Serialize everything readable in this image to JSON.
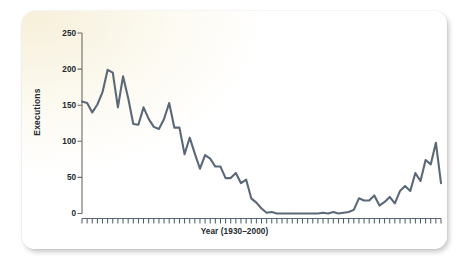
{
  "chart_data": {
    "type": "line",
    "title": "",
    "xlabel": "Year (1930–2000)",
    "ylabel": "Executions",
    "xlim": [
      1930,
      2000
    ],
    "ylim": [
      0,
      250
    ],
    "yticks": [
      0,
      50,
      100,
      150,
      200,
      250
    ],
    "grid": false,
    "legend": null,
    "line_color": "#5b6878",
    "x": [
      1930,
      1931,
      1932,
      1933,
      1934,
      1935,
      1936,
      1937,
      1938,
      1939,
      1940,
      1941,
      1942,
      1943,
      1944,
      1945,
      1946,
      1947,
      1948,
      1949,
      1950,
      1951,
      1952,
      1953,
      1954,
      1955,
      1956,
      1957,
      1958,
      1959,
      1960,
      1961,
      1962,
      1963,
      1964,
      1965,
      1966,
      1967,
      1968,
      1969,
      1970,
      1971,
      1972,
      1973,
      1974,
      1975,
      1976,
      1977,
      1978,
      1979,
      1980,
      1981,
      1982,
      1983,
      1984,
      1985,
      1986,
      1987,
      1988,
      1989,
      1990,
      1991,
      1992,
      1993,
      1994,
      1995,
      1996,
      1997,
      1998,
      1999,
      2000
    ],
    "values": [
      155,
      153,
      140,
      151,
      168,
      199,
      195,
      147,
      190,
      160,
      124,
      123,
      147,
      131,
      120,
      117,
      131,
      153,
      119,
      119,
      82,
      105,
      83,
      62,
      81,
      76,
      65,
      65,
      49,
      49,
      56,
      42,
      47,
      21,
      15,
      7,
      1,
      2,
      0,
      0,
      0,
      0,
      0,
      0,
      0,
      0,
      0,
      1,
      0,
      2,
      0,
      1,
      2,
      5,
      21,
      18,
      18,
      25,
      11,
      16,
      23,
      14,
      31,
      38,
      31,
      56,
      45,
      74,
      68,
      98,
      42
    ],
    "series_name": "Executions"
  },
  "axis": {
    "y_label": "Executions",
    "x_label": "Year (1930–2000)",
    "ytick_labels": [
      "250",
      "200",
      "150",
      "100",
      "50",
      "0"
    ]
  }
}
